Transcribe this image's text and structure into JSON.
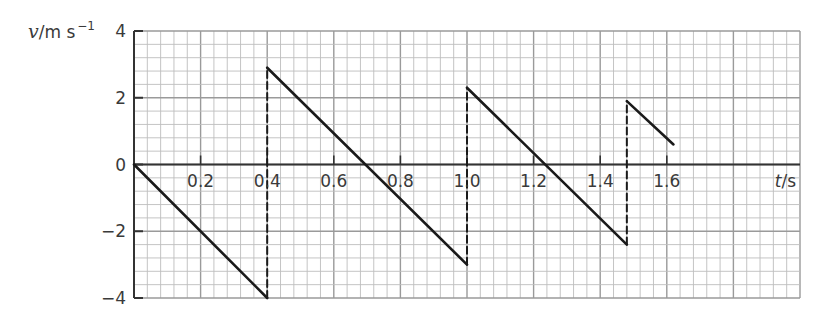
{
  "chart_data": {
    "type": "line",
    "title": "",
    "xlabel": "t/s",
    "ylabel": "v/m s^-1",
    "ylabel_parts": {
      "symbol": "v",
      "unit": "/m s",
      "exponent": "−1"
    },
    "xlim": [
      0,
      2.0
    ],
    "ylim": [
      -4,
      4
    ],
    "x_ticks": [
      "0.2",
      "0.4",
      "0.6",
      "0.8",
      "1.0",
      "1.2",
      "1.4",
      "1.6"
    ],
    "x_tick_values": [
      0.2,
      0.4,
      0.6,
      0.8,
      1.0,
      1.2,
      1.4,
      1.6
    ],
    "y_ticks": [
      "4",
      "2",
      "0",
      "−2",
      "−4"
    ],
    "y_tick_values": [
      4,
      2,
      0,
      -2,
      -4
    ],
    "grid": true,
    "grid_minor_x": 0.04,
    "grid_minor_y": 0.4,
    "legend": null,
    "series": [
      {
        "name": "velocity",
        "style": "solid",
        "segments": [
          [
            [
              0,
              0
            ],
            [
              0.4,
              -4.0
            ]
          ],
          [
            [
              0.4,
              2.9
            ],
            [
              1.0,
              -3.0
            ]
          ],
          [
            [
              1.0,
              2.3
            ],
            [
              1.48,
              -2.4
            ]
          ],
          [
            [
              1.48,
              1.9
            ],
            [
              1.62,
              0.6
            ]
          ]
        ]
      },
      {
        "name": "jumps",
        "style": "dashed",
        "segments": [
          [
            [
              0.4,
              -4.0
            ],
            [
              0.4,
              2.9
            ]
          ],
          [
            [
              1.0,
              -3.0
            ],
            [
              1.0,
              2.3
            ]
          ],
          [
            [
              1.48,
              -2.4
            ],
            [
              1.48,
              1.9
            ]
          ]
        ]
      }
    ]
  },
  "colors": {
    "grid_minor": "#bdbdbd",
    "grid_major": "#9a9a9a",
    "line": "#1a1a1a",
    "axis": "#333333"
  }
}
